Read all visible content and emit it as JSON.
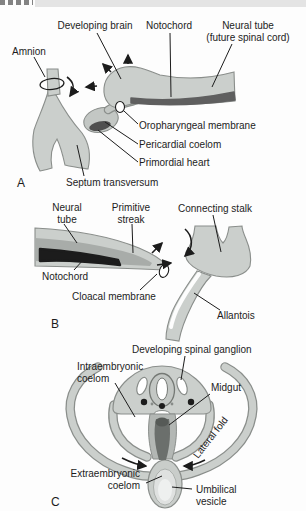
{
  "figure": {
    "panelA": {
      "letter": "A",
      "labels": {
        "developing_brain": "Developing brain",
        "notochord": "Notochord",
        "neural_tube_line1": "Neural tube",
        "neural_tube_line2": "(future spinal cord)",
        "amnion": "Amnion",
        "oropharyngeal_membrane": "Oropharyngeal membrane",
        "pericardial_coelom": "Pericardial coelom",
        "primordial_heart": "Primordial heart",
        "septum_transversum": "Septum transversum"
      }
    },
    "panelB": {
      "letter": "B",
      "labels": {
        "neural_tube_line1": "Neural",
        "neural_tube_line2": "tube",
        "primitive_streak_line1": "Primitive",
        "primitive_streak_line2": "streak",
        "connecting_stalk": "Connecting stalk",
        "notochord": "Notochord",
        "cloacal_membrane": "Cloacal membrane",
        "allantois": "Allantois"
      }
    },
    "panelC": {
      "letter": "C",
      "labels": {
        "developing_spinal_ganglion": "Developing spinal ganglion",
        "intraembryonic_coelom_line1": "Intraembryonic",
        "intraembryonic_coelom_line2": "coelom",
        "midgut": "Midgut",
        "lateral_fold": "Lateral fold",
        "extraembryonic_coelom_line1": "Extraembryonic",
        "extraembryonic_coelom_line2": "coelom",
        "umbilical_vesicle_line1": "Umbilical",
        "umbilical_vesicle_line2": "vesicle"
      }
    },
    "colors": {
      "tissue_light": "#cbcfcc",
      "tissue_medium": "#a8aca9",
      "notochord_dark_gray": "#5f5f5f",
      "notochord_black": "#1c1c1c",
      "heart_dark": "#4f4f4f",
      "outline": "#8a8e8b",
      "text": "#1c1c1c",
      "top_bar": "#e4e4e4"
    }
  }
}
